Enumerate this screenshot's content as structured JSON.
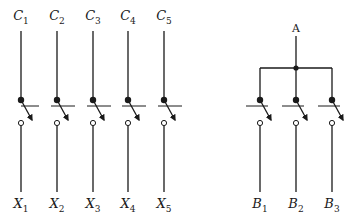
{
  "left_group": {
    "top_labels": [
      {
        "base": "C",
        "sub": "1"
      },
      {
        "base": "C",
        "sub": "2"
      },
      {
        "base": "C",
        "sub": "3"
      },
      {
        "base": "C",
        "sub": "4"
      },
      {
        "base": "C",
        "sub": "5"
      }
    ],
    "bottom_labels": [
      {
        "base": "X",
        "sub": "1"
      },
      {
        "base": "X",
        "sub": "2"
      },
      {
        "base": "X",
        "sub": "3"
      },
      {
        "base": "X",
        "sub": "4"
      },
      {
        "base": "X",
        "sub": "5"
      }
    ],
    "x_positions": [
      21,
      57,
      93,
      128,
      164
    ]
  },
  "right_group": {
    "top_label": "A",
    "bottom_labels": [
      {
        "base": "B",
        "sub": "1"
      },
      {
        "base": "B",
        "sub": "2"
      },
      {
        "base": "B",
        "sub": "3"
      }
    ],
    "x_positions": [
      260,
      296,
      332
    ]
  },
  "colors": {
    "stroke": "#1a1a1a",
    "background": "#ffffff"
  }
}
